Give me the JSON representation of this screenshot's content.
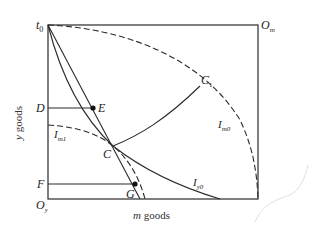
{
  "diagram": {
    "type": "edgeworth-box",
    "corners": {
      "top_left": {
        "label": "t",
        "sub": "0"
      },
      "top_right": {
        "label": "O",
        "sub": "m"
      },
      "bottom_left": {
        "label": "O",
        "sub": "y"
      }
    },
    "axes": {
      "x_label": "m goods",
      "x_label_italic": "m",
      "x_label_rest": " goods",
      "y_label": "y goods",
      "y_label_italic": "y",
      "y_label_rest": " goods"
    },
    "points": {
      "D": "D",
      "E": "E",
      "F": "F",
      "G": "G",
      "C": "C",
      "C1": {
        "label": "C",
        "sub": "1"
      }
    },
    "curves": {
      "Im1": {
        "label": "I",
        "sub": "m1"
      },
      "Im0": {
        "label": "I",
        "sub": "m0"
      },
      "Iy0": {
        "label": "I",
        "sub": "y0"
      }
    },
    "colors": {
      "line": "#2a2a2a",
      "background": "#ffffff",
      "scribble": "#dddddd"
    }
  }
}
